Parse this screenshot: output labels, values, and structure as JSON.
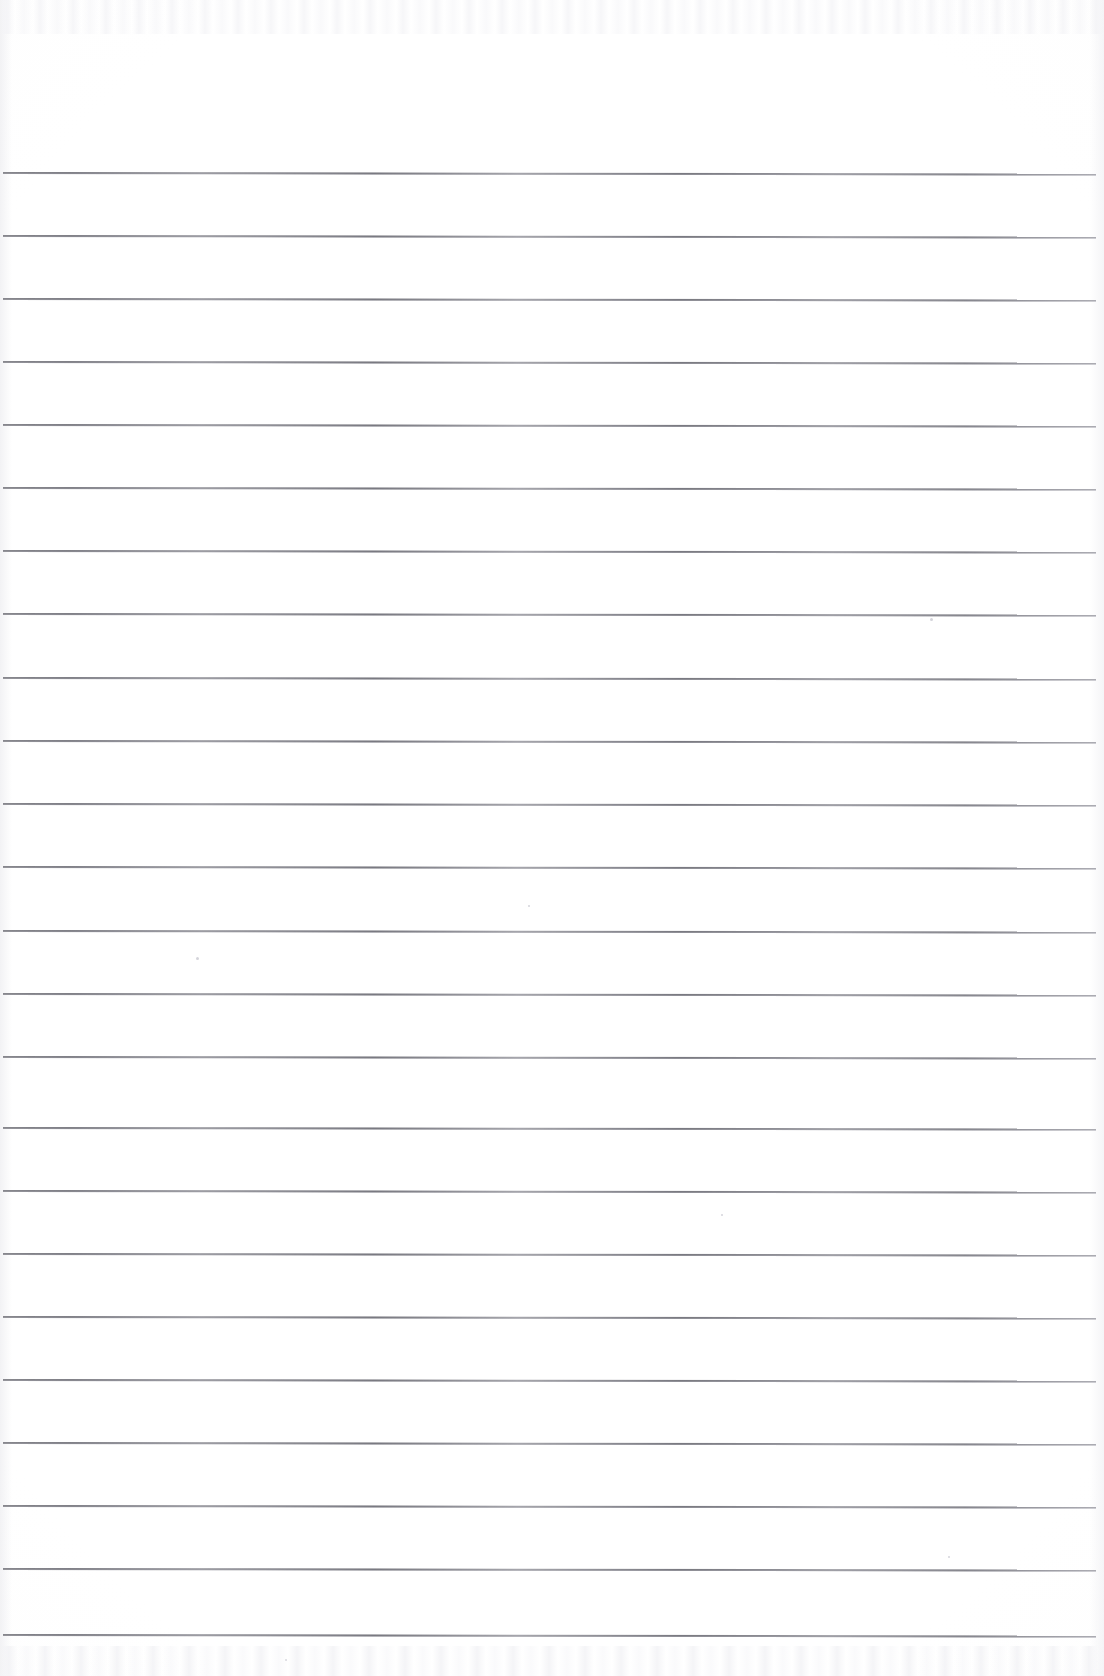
{
  "document": {
    "kind": "lined-notebook-page",
    "title": "Blank ruled notebook page",
    "content_text": "",
    "page_width": 1104,
    "page_height": 1676,
    "paper_color": "#ffffff",
    "rule_color": "#7a7a82",
    "header_area_height": 172,
    "written_content": "none"
  },
  "ruling": {
    "style": "wide-ruled horizontal lines",
    "line_count": 24,
    "first_line_y": 172,
    "last_line_y": 1634,
    "line_spacing": 63.6,
    "line_thickness": 1,
    "line_start_x": 3,
    "line_end_x": 1096,
    "margin_line": "none",
    "lines": [
      {
        "index": 1,
        "y": 172,
        "x1": 3,
        "x2": 1096,
        "slope_px": 1.5
      },
      {
        "index": 2,
        "y": 235,
        "x1": 3,
        "x2": 1096,
        "slope_px": 1.5
      },
      {
        "index": 3,
        "y": 298,
        "x1": 3,
        "x2": 1096,
        "slope_px": 1.5
      },
      {
        "index": 4,
        "y": 361,
        "x1": 3,
        "x2": 1096,
        "slope_px": 1.5
      },
      {
        "index": 5,
        "y": 424,
        "x1": 3,
        "x2": 1096,
        "slope_px": 1.5
      },
      {
        "index": 6,
        "y": 487,
        "x1": 3,
        "x2": 1096,
        "slope_px": 1.5
      },
      {
        "index": 7,
        "y": 550,
        "x1": 3,
        "x2": 1096,
        "slope_px": 1.5
      },
      {
        "index": 8,
        "y": 613,
        "x1": 3,
        "x2": 1096,
        "slope_px": 1.5
      },
      {
        "index": 9,
        "y": 677,
        "x1": 3,
        "x2": 1096,
        "slope_px": 1.5
      },
      {
        "index": 10,
        "y": 740,
        "x1": 3,
        "x2": 1096,
        "slope_px": 1.5
      },
      {
        "index": 11,
        "y": 803,
        "x1": 3,
        "x2": 1096,
        "slope_px": 1.5
      },
      {
        "index": 12,
        "y": 866,
        "x1": 3,
        "x2": 1096,
        "slope_px": 1.5
      },
      {
        "index": 13,
        "y": 930,
        "x1": 3,
        "x2": 1096,
        "slope_px": 1.5
      },
      {
        "index": 14,
        "y": 993,
        "x1": 3,
        "x2": 1096,
        "slope_px": 1.5
      },
      {
        "index": 15,
        "y": 1056,
        "x1": 3,
        "x2": 1096,
        "slope_px": 1.5
      },
      {
        "index": 16,
        "y": 1127,
        "x1": 3,
        "x2": 1096,
        "slope_px": 1.5
      },
      {
        "index": 17,
        "y": 1190,
        "x1": 3,
        "x2": 1096,
        "slope_px": 1.5
      },
      {
        "index": 18,
        "y": 1253,
        "x1": 3,
        "x2": 1096,
        "slope_px": 1.5
      },
      {
        "index": 19,
        "y": 1316,
        "x1": 3,
        "x2": 1096,
        "slope_px": 1.5
      },
      {
        "index": 20,
        "y": 1379,
        "x1": 3,
        "x2": 1096,
        "slope_px": 1.5
      },
      {
        "index": 21,
        "y": 1442,
        "x1": 3,
        "x2": 1096,
        "slope_px": 1.5
      },
      {
        "index": 22,
        "y": 1505,
        "x1": 3,
        "x2": 1096,
        "slope_px": 1.5
      },
      {
        "index": 23,
        "y": 1568,
        "x1": 3,
        "x2": 1096,
        "slope_px": 1.5
      },
      {
        "index": 24,
        "y": 1634,
        "x1": 3,
        "x2": 1096,
        "slope_px": 1.5
      }
    ]
  },
  "scan_artifacts": {
    "top_band_height": 34,
    "bottom_band_height": 30,
    "specks": [
      {
        "x": 930,
        "y": 618,
        "size": 3
      },
      {
        "x": 196,
        "y": 957,
        "size": 3
      },
      {
        "x": 528,
        "y": 905,
        "size": 2
      },
      {
        "x": 285,
        "y": 1659,
        "size": 2
      },
      {
        "x": 721,
        "y": 1214,
        "size": 2
      },
      {
        "x": 948,
        "y": 1556,
        "size": 2
      }
    ]
  }
}
